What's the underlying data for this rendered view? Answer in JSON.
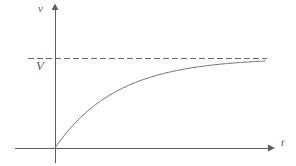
{
  "figure": {
    "background_color": "#ffffff",
    "line_color": "#5f5f5f",
    "curve_color": "#6a6a6a",
    "dashed_color": "#6a6a6a",
    "label_color": "#5a5a5a",
    "width": 296,
    "height": 166
  },
  "labels": {
    "y_axis": "v",
    "x_axis": "t",
    "asymptote": "V"
  },
  "chart_data": {
    "type": "line",
    "title": "",
    "xlabel": "t",
    "ylabel": "v",
    "grid": false,
    "legend": null,
    "axes": {
      "origin_px": [
        55,
        148
      ],
      "x_axis_y_px": 148,
      "y_axis_x_px": 55,
      "x_axis_start_px": 15,
      "x_axis_end_px": 272,
      "y_axis_top_px": 6,
      "y_axis_bottom_px": 163,
      "x_arrow": true,
      "y_arrow": true,
      "xlim": [
        0,
        1
      ],
      "ylim": [
        0,
        1.08
      ],
      "tick_labels_x": [],
      "tick_labels_y": [
        "V"
      ]
    },
    "annotations": [
      {
        "name": "asymptote",
        "label": "V",
        "type": "horizontal-dashed-line",
        "y_value": 1.0,
        "y_px": 58,
        "x_start_px": 28,
        "x_end_px": 267,
        "dash": [
          6,
          3
        ]
      }
    ],
    "series": [
      {
        "name": "velocity",
        "description": "saturating exponential approach to terminal velocity V",
        "equation": "v = V (1 - e^(-t/tau))",
        "x": [
          0.0,
          0.05,
          0.1,
          0.15,
          0.2,
          0.25,
          0.3,
          0.35,
          0.4,
          0.45,
          0.5,
          0.55,
          0.6,
          0.65,
          0.7,
          0.75,
          0.8,
          0.85,
          0.9,
          0.95,
          1.0
        ],
        "y": [
          0.0,
          0.182,
          0.33,
          0.451,
          0.55,
          0.632,
          0.699,
          0.753,
          0.798,
          0.835,
          0.865,
          0.89,
          0.91,
          0.926,
          0.94,
          0.95,
          0.959,
          0.967,
          0.973,
          0.978,
          0.982
        ],
        "points_px": [
          [
            55,
            148
          ],
          [
            66,
            132
          ],
          [
            76,
            119
          ],
          [
            87,
            108
          ],
          [
            97,
            99
          ],
          [
            108,
            92
          ],
          [
            118,
            86
          ],
          [
            129,
            81
          ],
          [
            139,
            77
          ],
          [
            150,
            74
          ],
          [
            160,
            71
          ],
          [
            171,
            69
          ],
          [
            181,
            67
          ],
          [
            192,
            66
          ],
          [
            202,
            65
          ],
          [
            213,
            64
          ],
          [
            223,
            63
          ],
          [
            234,
            62
          ],
          [
            244,
            62
          ],
          [
            255,
            61
          ],
          [
            265,
            61
          ]
        ]
      }
    ]
  }
}
